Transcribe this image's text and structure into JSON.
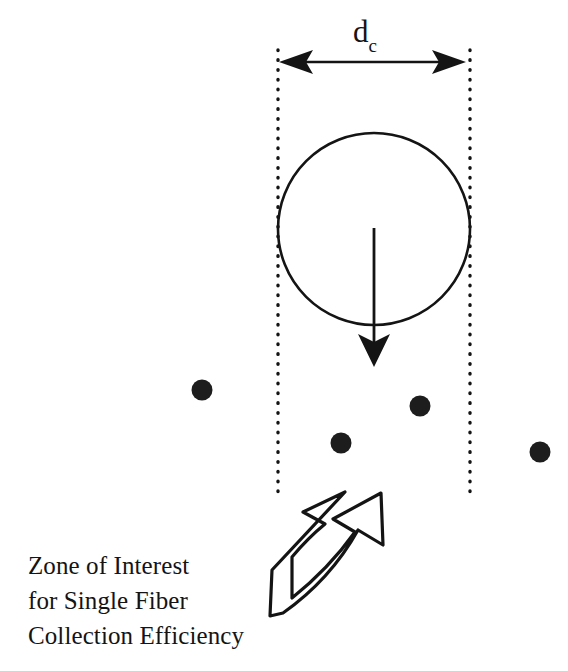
{
  "figure": {
    "title": "Zone of Interest for Single Fiber Collection Efficiency",
    "background_color": "#ffffff",
    "ink_color": "#141414",
    "width": 568,
    "height": 671
  },
  "dimension": {
    "label_symbol": "d",
    "label_subscript": "c",
    "label_full": "dc",
    "arrow_start_x": 280,
    "arrow_end_x": 465,
    "arrow_y": 62
  },
  "zone": {
    "left_boundary_x": 278,
    "right_boundary_x": 470,
    "boundary_top_y": 50,
    "boundary_bottom_y": 497,
    "boundary_style": "dotted"
  },
  "fiber": {
    "shape": "circle",
    "center_x": 374,
    "center_y": 229,
    "radius": 96
  },
  "flow_arrow": {
    "x": 374,
    "start_y": 228,
    "end_y": 366,
    "direction": "down"
  },
  "particles": [
    {
      "name": "particle-1",
      "cx": 202,
      "cy": 390,
      "r": 10
    },
    {
      "name": "particle-2",
      "cx": 420,
      "cy": 406,
      "r": 10
    },
    {
      "name": "particle-3",
      "cx": 341,
      "cy": 443,
      "r": 10
    },
    {
      "name": "particle-4",
      "cx": 540,
      "cy": 452,
      "r": 10
    }
  ],
  "callout_arrow": {
    "description": "curved block arrow pointing up and to the right",
    "fill": "#ffffff",
    "stroke": "#141414"
  },
  "caption": {
    "lines": [
      "Zone of Interest",
      "for Single Fiber",
      "Collection Efficiency"
    ],
    "line1": "Zone of Interest",
    "line2": "for Single Fiber",
    "line3": "Collection Efficiency"
  }
}
